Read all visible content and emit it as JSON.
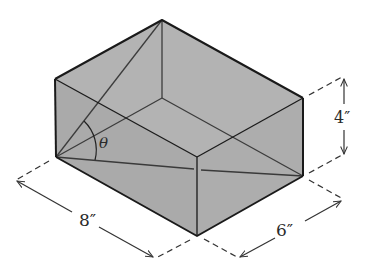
{
  "figure": {
    "type": "rectangular box with interior diagonals",
    "colors": {
      "face_fill": "#b0b0b0",
      "edge": "#1a1a1a",
      "inner_line": "#3c3c3c",
      "dim_line": "#333333",
      "background": "#ffffff"
    },
    "labels": {
      "length": "8″",
      "width": "6″",
      "height": "4″",
      "angle": "θ"
    },
    "dimensions": {
      "length_in": 8,
      "width_in": 6,
      "height_in": 4
    }
  }
}
